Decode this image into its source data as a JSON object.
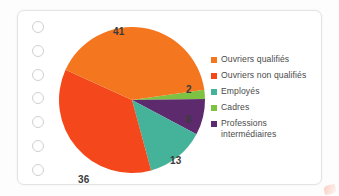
{
  "card": {
    "holes_count": 7,
    "hole_icon": "circle-hole-icon"
  },
  "chart_data": {
    "type": "pie",
    "title": "",
    "categories": [
      "Ouvriers qualifiés",
      "Ouvriers non qualifiés",
      "Employés",
      "Cadres",
      "Professions intermédiaires"
    ],
    "values": [
      41,
      36,
      13,
      2,
      8
    ],
    "value_labels": [
      "41",
      "36",
      "13",
      "2",
      "8"
    ],
    "colors": [
      "#F4761F",
      "#F4481C",
      "#45B39A",
      "#7DC242",
      "#5E2A6E"
    ],
    "legend_position": "right",
    "grid": false,
    "xlabel": "",
    "ylabel": ""
  },
  "legend": {
    "items": [
      {
        "label": "Ouvriers qualifiés",
        "color": "#F4761F"
      },
      {
        "label": "Ouvriers non qualifiés",
        "color": "#F4481C"
      },
      {
        "label": "Employés",
        "color": "#45B39A"
      },
      {
        "label": "Cadres",
        "color": "#7DC242"
      },
      {
        "label": "Professions intermédiaires",
        "color": "#5E2A6E"
      }
    ]
  }
}
